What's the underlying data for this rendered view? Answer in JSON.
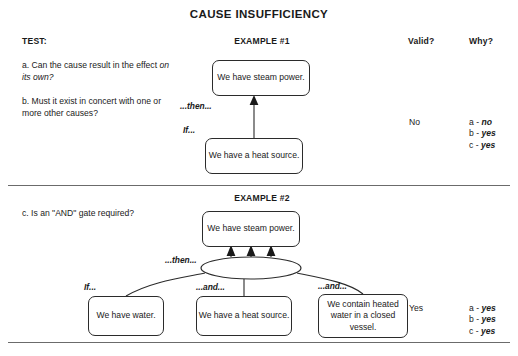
{
  "title": "CAUSE INSUFFICIENCY",
  "headers": {
    "test": "TEST:",
    "example1": "EXAMPLE #1",
    "example2": "EXAMPLE #2",
    "valid": "Valid?",
    "why": "Why?"
  },
  "questions": {
    "a_prefix": "a. Can the cause result in the effect ",
    "a_italic": "on its own?",
    "b": "b. Must it exist in concert with one or more other causes?",
    "c": "c. Is an \"AND\" gate required?"
  },
  "connectors": {
    "then": "...then...",
    "if": "If...",
    "and": "...and..."
  },
  "example1": {
    "effect_node": "We have steam power.",
    "cause_node": "We have a heat source.",
    "verdict": "No",
    "answers": [
      {
        "key": "a - ",
        "value": "no"
      },
      {
        "key": "b - ",
        "value": "yes"
      },
      {
        "key": "c - ",
        "value": "yes"
      }
    ]
  },
  "example2": {
    "effect_node": "We have steam power.",
    "cause_nodes": [
      "We have water.",
      "We have a heat source.",
      "We contain heated water in a closed vessel."
    ],
    "gate": "AND",
    "verdict": "Yes",
    "answers": [
      {
        "key": "a - ",
        "value": "yes"
      },
      {
        "key": "b - ",
        "value": "yes"
      },
      {
        "key": "c - ",
        "value": "yes"
      }
    ]
  },
  "colors": {
    "ink": "#1a1a1a",
    "line": "#2b2b2b",
    "rule": "#6b6b6b",
    "paper": "#ffffff"
  }
}
